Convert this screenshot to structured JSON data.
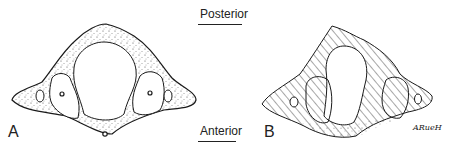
{
  "figure": {
    "orientation": {
      "top_label": "Posterior",
      "bottom_label": "Anterior"
    },
    "panels": [
      {
        "letter": "A",
        "style": "stippled-outline",
        "description": "vertebra cross-section drawing"
      },
      {
        "letter": "B",
        "style": "hatched-with-stippled-anterior",
        "description": "vertebra cross-section schematic"
      }
    ],
    "signature": "ARueH"
  },
  "colors": {
    "ink": "#1a1a1a",
    "background": "#ffffff"
  }
}
